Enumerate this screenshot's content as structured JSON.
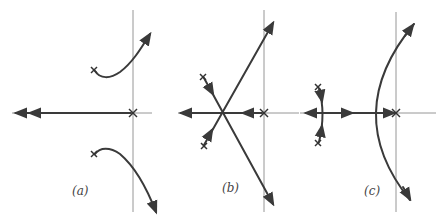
{
  "figure": {
    "panels": [
      {
        "id": "a",
        "label": "(a)",
        "poles": [
          [
            0,
            0
          ],
          [
            -1,
            1
          ],
          [
            -1,
            -1
          ]
        ],
        "branches": "two curved branches from complex poles to asymptotes in RHP; real axis locus to -infinity"
      },
      {
        "id": "b",
        "label": "(b)",
        "poles": [
          [
            0,
            0
          ],
          [
            -1,
            1
          ],
          [
            -1,
            -1
          ]
        ],
        "branches": "straight-line asymptotes intersecting on negative real axis"
      },
      {
        "id": "c",
        "label": "(c)",
        "poles": [
          [
            0,
            0
          ],
          [
            -1,
            0.6
          ],
          [
            -1,
            -0.6
          ]
        ],
        "branches": "small arc near left poles and large parabola-like branch crossing imaginary axis"
      }
    ]
  },
  "colors": {
    "axis": "#8a8a8a",
    "locus": "#3a3a3a",
    "pole": "#333333"
  }
}
